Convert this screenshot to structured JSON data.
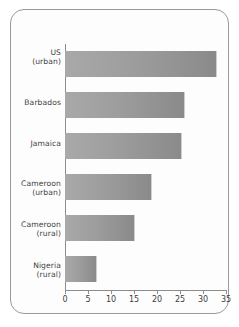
{
  "chart_data": {
    "type": "bar",
    "orientation": "horizontal",
    "title": "",
    "xlabel": "",
    "ylabel": "",
    "xlim": [
      0,
      35
    ],
    "xticks": [
      0,
      5,
      10,
      15,
      20,
      25,
      30,
      35
    ],
    "grid": false,
    "legend": null,
    "categories": [
      "US\n(urban)",
      "Barbados",
      "Jamaica",
      "Cameroon\n(urban)",
      "Cameroon\n(rural)",
      "Nigeria\n(rural)"
    ],
    "values": [
      33,
      26,
      25.5,
      19,
      15.3,
      7
    ],
    "bars": [
      {
        "label_line1": "US",
        "label_line2": "(urban)",
        "value": 33
      },
      {
        "label_line1": "Barbados",
        "label_line2": "",
        "value": 26
      },
      {
        "label_line1": "Jamaica",
        "label_line2": "",
        "value": 25.5
      },
      {
        "label_line1": "Cameroon",
        "label_line2": "(urban)",
        "value": 19
      },
      {
        "label_line1": "Cameroon",
        "label_line2": "(rural)",
        "value": 15.3
      },
      {
        "label_line1": "Nigeria",
        "label_line2": "(rural)",
        "value": 7
      }
    ],
    "tick_labels": [
      "0",
      "5",
      "10",
      "15",
      "20",
      "25",
      "30",
      "35"
    ],
    "colors": {
      "bar_gradient_start": "#a9a9a9",
      "bar_gradient_end": "#8a8a8a",
      "axis": "#8d8d8d",
      "text": "#3d3d3d",
      "frame_border": "#9a9a9a",
      "background": "#ffffff"
    }
  }
}
